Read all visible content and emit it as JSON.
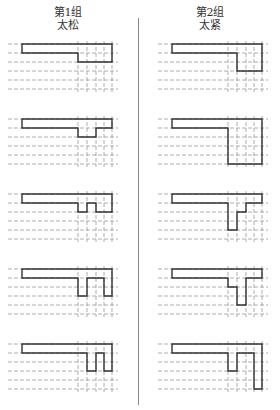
{
  "columns": [
    {
      "group_label": "第1组",
      "state_label": "太松",
      "x_origin": 78,
      "bar_left": 22
    },
    {
      "group_label": "第2组",
      "state_label": "太紧",
      "x_origin": 228,
      "bar_left": 172
    }
  ],
  "grid": {
    "row_spacing": 9,
    "rows": 6,
    "vertical_offsets": [
      0,
      9,
      18,
      26,
      34
    ],
    "dash_start_left": 8,
    "dash_start_right": 158
  },
  "panel_tops": [
    44,
    119,
    194,
    269,
    344
  ],
  "shapes": {
    "left": [
      [
        [
          -56,
          0
        ],
        [
          34,
          0
        ],
        [
          34,
          18
        ],
        [
          0,
          18
        ],
        [
          0,
          9
        ],
        [
          -56,
          9
        ]
      ],
      [
        [
          -56,
          0
        ],
        [
          34,
          0
        ],
        [
          34,
          9
        ],
        [
          18,
          9
        ],
        [
          18,
          18
        ],
        [
          0,
          18
        ],
        [
          0,
          9
        ],
        [
          -56,
          9
        ]
      ],
      [
        [
          -56,
          0
        ],
        [
          34,
          0
        ],
        [
          34,
          18
        ],
        [
          18,
          18
        ],
        [
          18,
          9
        ],
        [
          9,
          9
        ],
        [
          9,
          18
        ],
        [
          0,
          18
        ],
        [
          0,
          9
        ],
        [
          -56,
          9
        ]
      ],
      [
        [
          -56,
          0
        ],
        [
          34,
          0
        ],
        [
          34,
          27
        ],
        [
          26,
          27
        ],
        [
          26,
          9
        ],
        [
          9,
          9
        ],
        [
          9,
          27
        ],
        [
          0,
          27
        ],
        [
          0,
          9
        ],
        [
          -56,
          9
        ]
      ],
      [
        [
          -56,
          0
        ],
        [
          34,
          0
        ],
        [
          34,
          27
        ],
        [
          26,
          27
        ],
        [
          26,
          9
        ],
        [
          18,
          9
        ],
        [
          18,
          27
        ],
        [
          9,
          27
        ],
        [
          9,
          9
        ],
        [
          -56,
          9
        ]
      ]
    ],
    "right": [
      [
        [
          -56,
          0
        ],
        [
          34,
          0
        ],
        [
          34,
          27
        ],
        [
          9,
          27
        ],
        [
          9,
          9
        ],
        [
          -56,
          9
        ]
      ],
      [
        [
          -56,
          0
        ],
        [
          34,
          0
        ],
        [
          34,
          45
        ],
        [
          0,
          45
        ],
        [
          0,
          9
        ],
        [
          -56,
          9
        ]
      ],
      [
        [
          -56,
          0
        ],
        [
          34,
          0
        ],
        [
          34,
          9
        ],
        [
          18,
          9
        ],
        [
          18,
          18
        ],
        [
          9,
          18
        ],
        [
          9,
          36
        ],
        [
          0,
          36
        ],
        [
          0,
          9
        ],
        [
          -56,
          9
        ]
      ],
      [
        [
          -56,
          0
        ],
        [
          34,
          0
        ],
        [
          34,
          9
        ],
        [
          18,
          9
        ],
        [
          18,
          36
        ],
        [
          9,
          36
        ],
        [
          9,
          18
        ],
        [
          0,
          18
        ],
        [
          0,
          9
        ],
        [
          -56,
          9
        ]
      ],
      [
        [
          -56,
          0
        ],
        [
          34,
          0
        ],
        [
          34,
          45
        ],
        [
          26,
          45
        ],
        [
          26,
          9
        ],
        [
          9,
          9
        ],
        [
          9,
          27
        ],
        [
          0,
          27
        ],
        [
          0,
          9
        ],
        [
          -56,
          9
        ]
      ]
    ]
  },
  "colors": {
    "outline": "#333333",
    "grid": "#9a9a9a",
    "divider": "#888888"
  }
}
